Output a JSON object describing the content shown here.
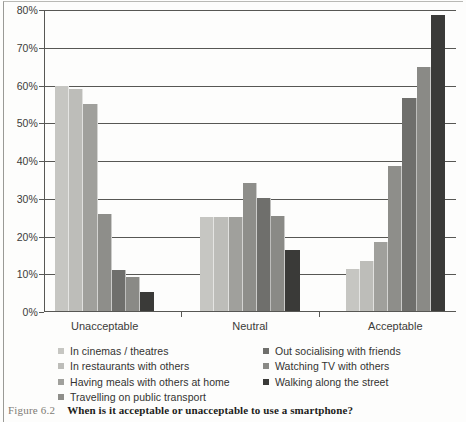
{
  "figure": {
    "label": "Figure 6.2",
    "caption": "When is it acceptable or unacceptable to use a smartphone?"
  },
  "chart_data": {
    "type": "bar",
    "title": "When is it acceptable or unacceptable to use a smartphone?",
    "xlabel": "",
    "ylabel": "",
    "ylim": [
      0,
      80
    ],
    "ytick_labels": [
      "0%",
      "10%",
      "20%",
      "30%",
      "40%",
      "50%",
      "60%",
      "70%",
      "80%"
    ],
    "ytick_values": [
      0,
      10,
      20,
      30,
      40,
      50,
      60,
      70,
      80
    ],
    "grid": true,
    "legend_position": "bottom",
    "categories": [
      "Unacceptable",
      "Neutral",
      "Acceptable"
    ],
    "series": [
      {
        "name": "In cinemas / theatres",
        "color": "#c6c6c2",
        "values": [
          60.0,
          25.2,
          11.4
        ]
      },
      {
        "name": "In restaurants with others",
        "color": "#bdbdb9",
        "values": [
          59.0,
          25.2,
          13.4
        ]
      },
      {
        "name": "Having meals with others at home",
        "color": "#a0a09c",
        "values": [
          55.0,
          25.2,
          18.6
        ]
      },
      {
        "name": "Travelling on public transport",
        "color": "#8e8e8a",
        "values": [
          26.0,
          34.3,
          38.6
        ]
      },
      {
        "name": "Out socialising with friends",
        "color": "#6f6f6c",
        "values": [
          11.1,
          30.3,
          56.7
        ]
      },
      {
        "name": "Watching TV with others",
        "color": "#8a8a86",
        "values": [
          9.2,
          25.4,
          64.8
        ]
      },
      {
        "name": "Walking along the street",
        "color": "#3a3a38",
        "values": [
          5.2,
          16.3,
          78.8
        ]
      }
    ],
    "legend_columns": [
      [
        "In cinemas / theatres",
        "In restaurants with others",
        "Having meals with others at home",
        "Travelling on public transport"
      ],
      [
        "Out socialising with friends",
        "Watching TV with others",
        "Walking along the street"
      ]
    ]
  }
}
